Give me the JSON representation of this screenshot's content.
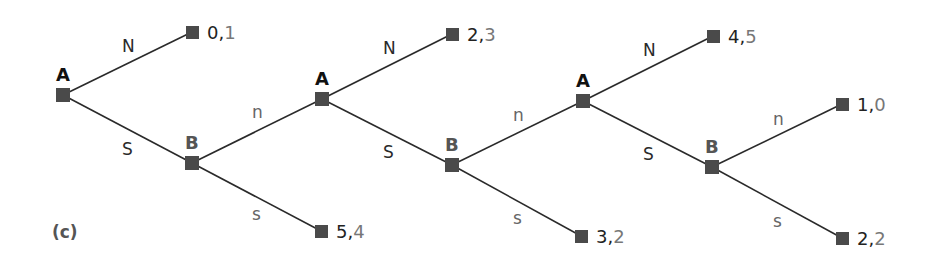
{
  "caption": "(c)",
  "colors": {
    "edge": "#2a2a2a",
    "node": "#4a4a4a",
    "player_a": "#111111",
    "player_b": "#555555",
    "payoff_first": "#222222",
    "payoff_second": "#777777"
  },
  "decision_nodes": [
    {
      "id": "A1",
      "player": "A",
      "x": 63,
      "y": 95
    },
    {
      "id": "B1",
      "player": "B",
      "x": 192,
      "y": 163
    },
    {
      "id": "A2",
      "player": "A",
      "x": 322,
      "y": 99
    },
    {
      "id": "B2",
      "player": "B",
      "x": 452,
      "y": 165
    },
    {
      "id": "A3",
      "player": "A",
      "x": 583,
      "y": 101
    },
    {
      "id": "B3",
      "player": "B",
      "x": 712,
      "y": 167
    }
  ],
  "terminal_nodes": [
    {
      "id": "T1",
      "x": 192,
      "y": 32,
      "p1": "0",
      "p2": "1"
    },
    {
      "id": "T2",
      "x": 321,
      "y": 231,
      "p1": "5",
      "p2": "4"
    },
    {
      "id": "T3",
      "x": 452,
      "y": 34,
      "p1": "2",
      "p2": "3"
    },
    {
      "id": "T4",
      "x": 581,
      "y": 236,
      "p1": "3",
      "p2": "2"
    },
    {
      "id": "T5",
      "x": 713,
      "y": 36,
      "p1": "4",
      "p2": "5"
    },
    {
      "id": "T6",
      "x": 842,
      "y": 104,
      "p1": "1",
      "p2": "0"
    },
    {
      "id": "T7",
      "x": 842,
      "y": 238,
      "p1": "2",
      "p2": "2"
    }
  ],
  "edges": [
    {
      "from": "A1",
      "to": "T1",
      "label": "N"
    },
    {
      "from": "A1",
      "to": "B1",
      "label": "S"
    },
    {
      "from": "B1",
      "to": "A2",
      "label": "n"
    },
    {
      "from": "B1",
      "to": "T2",
      "label": "s"
    },
    {
      "from": "A2",
      "to": "T3",
      "label": "N"
    },
    {
      "from": "A2",
      "to": "B2",
      "label": "S"
    },
    {
      "from": "B2",
      "to": "A3",
      "label": "n"
    },
    {
      "from": "B2",
      "to": "T4",
      "label": "s"
    },
    {
      "from": "A3",
      "to": "T5",
      "label": "N"
    },
    {
      "from": "A3",
      "to": "B3",
      "label": "S"
    },
    {
      "from": "B3",
      "to": "T6",
      "label": "n"
    },
    {
      "from": "B3",
      "to": "T7",
      "label": "s"
    }
  ],
  "labels": {
    "A1": "A",
    "B1": "B",
    "A2": "A",
    "B2": "B",
    "A3": "A",
    "B3": "B",
    "e1": "N",
    "e2": "S",
    "e3": "n",
    "e4": "s",
    "e5": "N",
    "e6": "S",
    "e7": "n",
    "e8": "s",
    "e9": "N",
    "e10": "S",
    "e11": "n",
    "e12": "s",
    "T1a": "0,",
    "T1b": "1",
    "T2a": "5,",
    "T2b": "4",
    "T3a": "2,",
    "T3b": "3",
    "T4a": "3,",
    "T4b": "2",
    "T5a": "4,",
    "T5b": "5",
    "T6a": "1,",
    "T6b": "0",
    "T7a": "2,",
    "T7b": "2"
  }
}
